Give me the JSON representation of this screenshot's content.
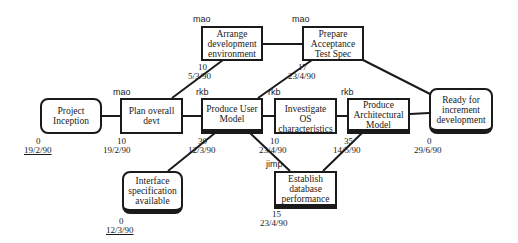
{
  "diagram": {
    "type": "activity-network",
    "nodes": [
      {
        "id": "project-inception",
        "label": "Project\nInception",
        "shape": "milestone",
        "owner": "",
        "duration": "0",
        "date": "19/2/90",
        "date_underlined": true
      },
      {
        "id": "plan-overall-devt",
        "label": "Plan overall\ndevt",
        "shape": "activity",
        "owner": "mao",
        "duration": "10",
        "date": "19/2/90",
        "date_underlined": false
      },
      {
        "id": "arrange-development-environment",
        "label": "Arrange\ndevelopment\nenvironment",
        "shape": "activity",
        "owner": "mao",
        "duration": "10",
        "date": "5/3/90",
        "date_underlined": false
      },
      {
        "id": "prepare-acceptance-test-spec",
        "label": "Prepare\nAcceptance\nTest Spec",
        "shape": "activity",
        "owner": "mao",
        "duration": "17",
        "date": "23/4/90",
        "date_underlined": false
      },
      {
        "id": "produce-user-model",
        "label": "Produce User\nModel",
        "shape": "activity",
        "owner": "rkb",
        "duration": "30",
        "date": "12/3/90",
        "date_underlined": false
      },
      {
        "id": "investigate-os-characteristics",
        "label": "Investigate OS\ncharacteristics",
        "shape": "activity",
        "owner": "rkb",
        "duration": "10",
        "date": "23/4/90",
        "date_underlined": false
      },
      {
        "id": "produce-architectural-model",
        "label": "Produce\nArchitectural\nModel",
        "shape": "activity",
        "owner": "rkb",
        "duration": "35",
        "date": "14/5/90",
        "date_underlined": false
      },
      {
        "id": "ready-for-increment-development",
        "label": "Ready for\nincrement\ndevelopment",
        "shape": "milestone",
        "owner": "",
        "duration": "0",
        "date": "29/6/90",
        "date_underlined": false
      },
      {
        "id": "interface-specification-available",
        "label": "Interface\nspecification\navailable",
        "shape": "milestone",
        "owner": "",
        "duration": "0",
        "date": "12/3/90",
        "date_underlined": true
      },
      {
        "id": "establish-database-performance",
        "label": "Establish\ndatabase\nperformance",
        "shape": "activity",
        "owner": "jimp",
        "duration": "15",
        "date": "23/4/90",
        "date_underlined": false
      }
    ],
    "edges": [
      [
        "project-inception",
        "plan-overall-devt"
      ],
      [
        "plan-overall-devt",
        "produce-user-model"
      ],
      [
        "plan-overall-devt",
        "arrange-development-environment"
      ],
      [
        "arrange-development-environment",
        "prepare-acceptance-test-spec"
      ],
      [
        "produce-user-model",
        "prepare-acceptance-test-spec"
      ],
      [
        "produce-user-model",
        "investigate-os-characteristics"
      ],
      [
        "produce-user-model",
        "interface-specification-available"
      ],
      [
        "produce-user-model",
        "establish-database-performance"
      ],
      [
        "investigate-os-characteristics",
        "produce-architectural-model"
      ],
      [
        "establish-database-performance",
        "produce-architectural-model"
      ],
      [
        "produce-architectural-model",
        "ready-for-increment-development"
      ],
      [
        "prepare-acceptance-test-spec",
        "ready-for-increment-development"
      ]
    ]
  }
}
